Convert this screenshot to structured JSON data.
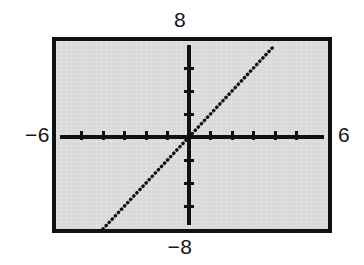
{
  "figure": {
    "kind": "graphing-calculator-plot",
    "background_color": "#d9d9d9",
    "frame_color": "#111111",
    "ink_color": "#111111",
    "page_color": "#ffffff"
  },
  "labels": {
    "ymax": "8",
    "ymin": "−8",
    "xmin": "−6",
    "xmax": "6"
  },
  "chart_data": {
    "type": "line",
    "title": "",
    "subtitle": "",
    "xlabel": "",
    "ylabel": "",
    "xlim": [
      -6,
      6
    ],
    "ylim": [
      -8,
      8
    ],
    "xtick_labels": [
      "-6",
      "6"
    ],
    "ytick_labels": [
      "8",
      "-8"
    ],
    "xticks": [
      -5,
      -4,
      -3,
      -2,
      -1,
      1,
      2,
      3,
      4,
      5
    ],
    "yticks": [
      -6,
      -4,
      -2,
      2,
      4,
      6
    ],
    "xscl": 1,
    "yscl": 2,
    "grid": false,
    "legend": null,
    "axes_style": "centered-crosshair-with-tickmarks",
    "line_style": "dotted",
    "annotations": [],
    "series": [
      {
        "name": "y = 2x",
        "equation": "y = 2x",
        "slope": 2,
        "intercept": 0,
        "style": "dotted",
        "x": [
          -4.0,
          -3.0,
          -2.0,
          -1.0,
          0.0,
          1.0,
          2.0,
          3.0,
          4.0
        ],
        "values": [
          -8.0,
          -6.0,
          -4.0,
          -2.0,
          0.0,
          2.0,
          4.0,
          6.0,
          8.0
        ],
        "endpoints": [
          [
            -4.0,
            -8.0
          ],
          [
            4.0,
            8.0
          ]
        ]
      }
    ]
  }
}
